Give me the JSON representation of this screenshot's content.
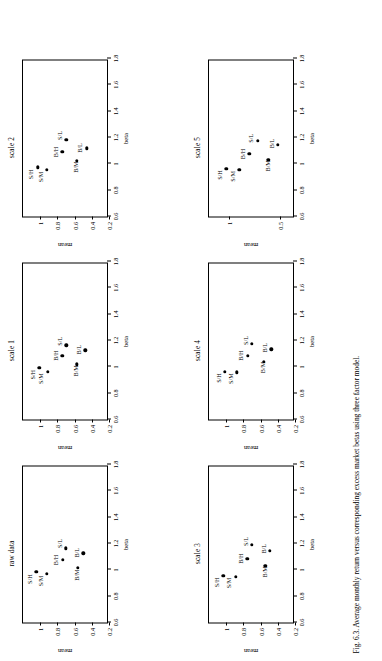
{
  "caption": "Fig. 6.3.   Average monthly return versus corresponding excess market betas using three factor model.",
  "axis": {
    "xlabel": "beta",
    "ylabel": "mean",
    "xticks": [
      "0.6",
      "0.8",
      "1",
      "1.2",
      "1.4",
      "1.6",
      "1.8"
    ],
    "xtickvals": [
      0.6,
      0.8,
      1,
      1.2,
      1.4,
      1.6,
      1.8
    ],
    "xlim": [
      0.6,
      1.8
    ]
  },
  "chart_data": [
    {
      "type": "scatter",
      "title": "raw data",
      "xlabel": "beta",
      "ylabel": "mean",
      "xlim": [
        0.6,
        1.8
      ],
      "ylim": [
        0.2,
        1.2
      ],
      "yticks": [
        0.2,
        0.4,
        0.6,
        0.8,
        1
      ],
      "yticklabels": [
        "0.2",
        "0.4",
        "0.6",
        "0.8",
        "1"
      ],
      "grid": false,
      "legend": "none",
      "points": [
        {
          "label": "S/H",
          "x": 0.985,
          "y": 1.045,
          "lx": -0.055,
          "ly": 0.085
        },
        {
          "label": "S/M",
          "x": 0.97,
          "y": 0.92,
          "lx": -0.055,
          "ly": 0.085
        },
        {
          "label": "B/H",
          "x": 1.075,
          "y": 0.74,
          "lx": 0.0,
          "ly": 0.085
        },
        {
          "label": "S/L",
          "x": 1.165,
          "y": 0.7,
          "lx": 0.035,
          "ly": 0.085
        },
        {
          "label": "B/M",
          "x": 1.015,
          "y": 0.565,
          "lx": -0.055,
          "ly": 0.02
        },
        {
          "label": "B/L",
          "x": 1.125,
          "y": 0.5,
          "lx": 0.005,
          "ly": 0.085
        }
      ]
    },
    {
      "type": "scatter",
      "title": "scale 1",
      "xlabel": "beta",
      "ylabel": "mean",
      "xlim": [
        0.6,
        1.8
      ],
      "ylim": [
        0.2,
        1.2
      ],
      "yticks": [
        0.2,
        0.4,
        0.6,
        0.8,
        1
      ],
      "yticklabels": [
        "0.2",
        "0.4",
        "0.6",
        "0.8",
        "1"
      ],
      "grid": false,
      "legend": "none",
      "points": [
        {
          "label": "S/H",
          "x": 0.995,
          "y": 1.01,
          "lx": -0.055,
          "ly": 0.085
        },
        {
          "label": "S/M",
          "x": 0.965,
          "y": 0.915,
          "lx": -0.055,
          "ly": 0.085
        },
        {
          "label": "B/H",
          "x": 1.085,
          "y": 0.745,
          "lx": 0.0,
          "ly": 0.085
        },
        {
          "label": "S/L",
          "x": 1.165,
          "y": 0.695,
          "lx": 0.03,
          "ly": 0.085
        },
        {
          "label": "B/M",
          "x": 1.02,
          "y": 0.575,
          "lx": -0.05,
          "ly": 0.02
        },
        {
          "label": "B/L",
          "x": 1.125,
          "y": 0.475,
          "lx": 0.005,
          "ly": 0.085
        }
      ]
    },
    {
      "type": "scatter",
      "title": "scale 2",
      "xlabel": "beta",
      "ylabel": "mean",
      "xlim": [
        0.6,
        1.8
      ],
      "ylim": [
        0.2,
        1.2
      ],
      "yticks": [
        0.2,
        0.4,
        0.6,
        0.8,
        1
      ],
      "yticklabels": [
        "0.2",
        "0.4",
        "0.6",
        "0.8",
        "1"
      ],
      "grid": false,
      "legend": "none",
      "points": [
        {
          "label": "S/H",
          "x": 0.975,
          "y": 1.03,
          "lx": -0.055,
          "ly": 0.085
        },
        {
          "label": "S/M",
          "x": 0.955,
          "y": 0.92,
          "lx": -0.055,
          "ly": 0.085
        },
        {
          "label": "B/H",
          "x": 1.09,
          "y": 0.745,
          "lx": 0.0,
          "ly": 0.085
        },
        {
          "label": "S/L",
          "x": 1.185,
          "y": 0.695,
          "lx": 0.03,
          "ly": 0.085
        },
        {
          "label": "B/M",
          "x": 1.025,
          "y": 0.575,
          "lx": -0.05,
          "ly": 0.02
        },
        {
          "label": "B/L",
          "x": 1.12,
          "y": 0.46,
          "lx": 0.0,
          "ly": 0.085
        }
      ]
    },
    {
      "type": "scatter",
      "title": "scale 3",
      "xlabel": "beta",
      "ylabel": "mean",
      "xlim": [
        0.6,
        1.8
      ],
      "ylim": [
        0.2,
        1.2
      ],
      "yticks": [
        0.2,
        0.4,
        0.6,
        0.8,
        1
      ],
      "yticklabels": [
        "0.2",
        "0.4",
        "0.6",
        "0.8",
        "1"
      ],
      "grid": false,
      "legend": "none",
      "points": [
        {
          "label": "S/H",
          "x": 0.955,
          "y": 1.035,
          "lx": -0.05,
          "ly": 0.085
        },
        {
          "label": "S/M",
          "x": 0.95,
          "y": 0.89,
          "lx": -0.05,
          "ly": 0.085
        },
        {
          "label": "B/H",
          "x": 1.085,
          "y": 0.755,
          "lx": 0.0,
          "ly": 0.085
        },
        {
          "label": "S/L",
          "x": 1.19,
          "y": 0.7,
          "lx": 0.025,
          "ly": 0.085
        },
        {
          "label": "B/M",
          "x": 1.03,
          "y": 0.545,
          "lx": -0.045,
          "ly": 0.015
        },
        {
          "label": "B/L",
          "x": 1.145,
          "y": 0.49,
          "lx": 0.015,
          "ly": 0.085
        }
      ]
    },
    {
      "type": "scatter",
      "title": "scale 4",
      "xlabel": "beta",
      "ylabel": "mean",
      "xlim": [
        0.6,
        1.8
      ],
      "ylim": [
        0.2,
        1.2
      ],
      "yticks": [
        0.2,
        0.4,
        0.6,
        0.8,
        1
      ],
      "yticklabels": [
        "0.2",
        "0.4",
        "0.6",
        "0.8",
        "1"
      ],
      "grid": false,
      "legend": "none",
      "points": [
        {
          "label": "S/H",
          "x": 0.965,
          "y": 1.015,
          "lx": -0.05,
          "ly": 0.085
        },
        {
          "label": "S/M",
          "x": 0.96,
          "y": 0.875,
          "lx": -0.05,
          "ly": 0.085
        },
        {
          "label": "B/H",
          "x": 1.085,
          "y": 0.75,
          "lx": 0.0,
          "ly": 0.085
        },
        {
          "label": "S/L",
          "x": 1.175,
          "y": 0.7,
          "lx": 0.025,
          "ly": 0.085
        },
        {
          "label": "B/M",
          "x": 1.04,
          "y": 0.565,
          "lx": -0.045,
          "ly": 0.02
        },
        {
          "label": "B/L",
          "x": 1.135,
          "y": 0.475,
          "lx": 0.01,
          "ly": 0.085
        }
      ]
    },
    {
      "type": "scatter",
      "title": "scale 5",
      "xlabel": "beta",
      "ylabel": "mean",
      "xlim": [
        0.6,
        1.8
      ],
      "ylim": [
        0.35,
        1.2
      ],
      "yticks": [
        0.5,
        1
      ],
      "yticklabels": [
        "0.5",
        "1"
      ],
      "grid": false,
      "legend": "none",
      "points": [
        {
          "label": "S/H",
          "x": 0.965,
          "y": 1.03,
          "lx": -0.05,
          "ly": 0.07
        },
        {
          "label": "S/M",
          "x": 0.955,
          "y": 0.9,
          "lx": -0.05,
          "ly": 0.07
        },
        {
          "label": "B/H",
          "x": 1.075,
          "y": 0.8,
          "lx": 0.0,
          "ly": 0.07
        },
        {
          "label": "S/L",
          "x": 1.175,
          "y": 0.72,
          "lx": 0.02,
          "ly": 0.07
        },
        {
          "label": "B/M",
          "x": 1.03,
          "y": 0.615,
          "lx": -0.045,
          "ly": 0.015
        },
        {
          "label": "B/L",
          "x": 1.145,
          "y": 0.52,
          "lx": 0.01,
          "ly": 0.07
        }
      ]
    }
  ]
}
